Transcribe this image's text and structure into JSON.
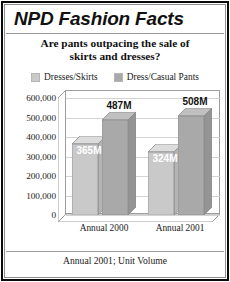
{
  "title": "NPD Fashion Facts",
  "subtitle_line1": "Are pants outpacing the sale of",
  "subtitle_line2": "skirts and dresses?",
  "footer": "Annual 2001; Unit Volume",
  "colors": {
    "series1": "#c9c9c9",
    "series1_top": "#dcdcdc",
    "series1_side": "#b4b4b4",
    "series2": "#a9a9a9",
    "series2_top": "#c0c0c0",
    "series2_side": "#949494",
    "frame": "#0a0a0a",
    "grid": "#d3d3d3",
    "text": "#141414"
  },
  "chart_data": {
    "type": "bar",
    "title": "Are pants outpacing the sale of skirts and dresses?",
    "subtitle": "NPD Fashion Facts",
    "xlabel": "",
    "ylabel": "",
    "ylim": [
      0,
      600000
    ],
    "grid": true,
    "legend_position": "top",
    "note": "Annual 2001; Unit Volume",
    "categories": [
      "Annual 2000",
      "Annual 2001"
    ],
    "yticks": [
      "0",
      "100,000",
      "200,000",
      "300,000",
      "400,000",
      "500,000",
      "600,000"
    ],
    "ytick_values": [
      0,
      100000,
      200000,
      300000,
      400000,
      500000,
      600000
    ],
    "series": [
      {
        "name": "Dresses/Skirts",
        "values": [
          365000,
          324000
        ],
        "data_labels": [
          "365M",
          "324M"
        ],
        "color": "#c9c9c9"
      },
      {
        "name": "Dress/Casual Pants",
        "values": [
          487000,
          508000
        ],
        "data_labels": [
          "487M",
          "508M"
        ],
        "color": "#a9a9a9"
      }
    ]
  },
  "legend": [
    {
      "label": "Dresses/Skirts",
      "color": "#c9c9c9"
    },
    {
      "label": "Dress/Casual Pants",
      "color": "#a9a9a9"
    }
  ],
  "bars": [
    {
      "label": "365M",
      "value": 365000,
      "series": "Dresses/Skirts",
      "category": "Annual 2000"
    },
    {
      "label": "487M",
      "value": 487000,
      "series": "Dress/Casual Pants",
      "category": "Annual 2000"
    },
    {
      "label": "324M",
      "value": 324000,
      "series": "Dresses/Skirts",
      "category": "Annual 2001"
    },
    {
      "label": "508M",
      "value": 508000,
      "series": "Dress/Casual Pants",
      "category": "Annual 2001"
    }
  ]
}
